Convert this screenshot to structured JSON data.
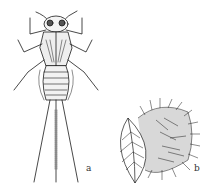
{
  "figure": {
    "panels": [
      {
        "id": "a",
        "label": "a",
        "subject": "insect nymph (dorsal view) with three long tail filaments"
      },
      {
        "id": "b",
        "label": "b",
        "subject": "leaf with attached bristly hair-covered mass"
      }
    ],
    "colors": {
      "ink": "#1a1a1a",
      "paper": "#ffffff"
    }
  }
}
